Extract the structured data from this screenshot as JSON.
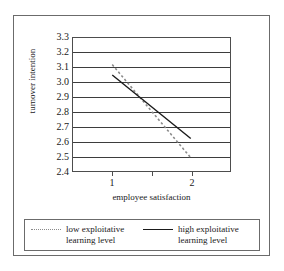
{
  "chart_data": {
    "type": "line",
    "title": "",
    "xlabel": "employee satisfaction",
    "ylabel": "turnover intention",
    "x": [
      1,
      2
    ],
    "xlim": [
      0.5,
      2.5
    ],
    "ylim": [
      2.4,
      3.3
    ],
    "x_tick_labels": [
      "1",
      "2"
    ],
    "y_tick_labels": [
      "3.3",
      "3.2",
      "3.1",
      "3.0",
      "2.9",
      "2.8",
      "2.7",
      "2.6",
      "2.5",
      "2.4"
    ],
    "y_ticks": [
      3.3,
      3.2,
      3.1,
      3.0,
      2.9,
      2.8,
      2.7,
      2.6,
      2.5,
      2.4
    ],
    "grid": "horizontal",
    "legend_position": "bottom",
    "series": [
      {
        "name": "low exploitative learning level",
        "style": "dotted",
        "color": "#8a8a8a",
        "values": [
          3.12,
          2.49
        ]
      },
      {
        "name": "high exploitative learning level",
        "style": "solid",
        "color": "#1a1a1a",
        "values": [
          3.05,
          2.62
        ]
      }
    ],
    "intersection": {
      "x": 1.45,
      "y": 2.89
    }
  },
  "axes": {
    "y_title": "turnover intention",
    "x_title": "employee satisfaction",
    "y_tick_labels": [
      "3.3",
      "3.2",
      "3.1",
      "3.0",
      "2.9",
      "2.8",
      "2.7",
      "2.6",
      "2.5",
      "2.4"
    ],
    "x_tick_labels": [
      "1",
      "2"
    ]
  },
  "legend": {
    "entries": [
      {
        "label_line1": "low exploitative",
        "label_line2": "learning level",
        "label": "low exploitative\nlearning level",
        "marker": "dotted-line-swatch"
      },
      {
        "label_line1": "high exploitative",
        "label_line2": "learning level",
        "label": "high exploitative\nlearning level",
        "marker": "solid-line-swatch"
      }
    ]
  }
}
